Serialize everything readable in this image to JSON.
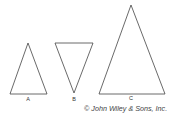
{
  "figure": {
    "triangles": [
      {
        "id": "A",
        "label": "A",
        "orientation": "point-up"
      },
      {
        "id": "B",
        "label": "B",
        "orientation": "point-down"
      },
      {
        "id": "C",
        "label": "C",
        "orientation": "point-up"
      }
    ],
    "credit": "© John Wiley & Sons, Inc."
  }
}
